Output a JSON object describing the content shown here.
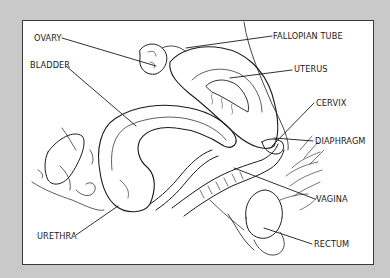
{
  "diagram": {
    "type": "anatomical-illustration",
    "colors": {
      "frame": "#c9c9c9",
      "panel": "#ffffff",
      "ink": "#1a1a1a"
    },
    "labels": [
      {
        "id": "ovary",
        "text": "OVARY"
      },
      {
        "id": "bladder",
        "text": "BLADDER"
      },
      {
        "id": "urethra",
        "text": "URETHRA"
      },
      {
        "id": "fallopian-tube",
        "text": "FALLOPIAN TUBE"
      },
      {
        "id": "uterus",
        "text": "UTERUS"
      },
      {
        "id": "cervix",
        "text": "CERVIX"
      },
      {
        "id": "diaphragm",
        "text": "DIAPHRAGM"
      },
      {
        "id": "vagina",
        "text": "VAGINA"
      },
      {
        "id": "rectum",
        "text": "RECTUM"
      }
    ]
  }
}
